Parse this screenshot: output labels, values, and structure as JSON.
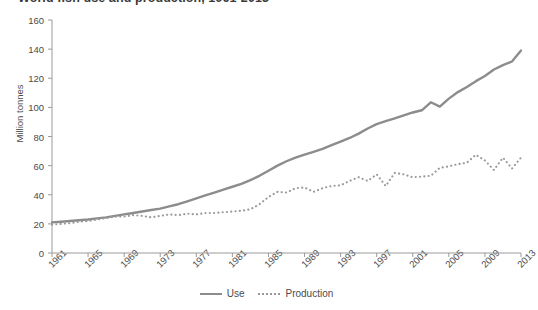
{
  "chart_data": {
    "type": "line",
    "title": "World fish use and production, 1961-2013",
    "xlabel": "",
    "ylabel": "Million tonnes",
    "ylim": [
      0,
      160
    ],
    "yticks": [
      0,
      20,
      40,
      60,
      80,
      100,
      120,
      140,
      160
    ],
    "xlim": [
      1961,
      2013
    ],
    "xticks": [
      1961,
      1965,
      1969,
      1973,
      1977,
      1981,
      1985,
      1989,
      1993,
      1997,
      2001,
      2005,
      2009,
      2013
    ],
    "xtick_labels": [
      "1961",
      "1965",
      "1969",
      "1973",
      "1977",
      "1981",
      "1985",
      "1989",
      "1993",
      "1997",
      "2001",
      "2005",
      "2009",
      "2013"
    ],
    "grid": false,
    "legend_position": "bottom-center",
    "x": [
      1961,
      1962,
      1963,
      1964,
      1965,
      1966,
      1967,
      1968,
      1969,
      1970,
      1971,
      1972,
      1973,
      1974,
      1975,
      1976,
      1977,
      1978,
      1979,
      1980,
      1981,
      1982,
      1983,
      1984,
      1985,
      1986,
      1987,
      1988,
      1989,
      1990,
      1991,
      1992,
      1993,
      1994,
      1995,
      1996,
      1997,
      1998,
      1999,
      2000,
      2001,
      2002,
      2003,
      2004,
      2005,
      2006,
      2007,
      2008,
      2009,
      2010,
      2011,
      2012,
      2013
    ],
    "series": [
      {
        "name": "Use",
        "style": "solid",
        "color": "#8c8c8c",
        "values": [
          21.0,
          21.5,
          22.0,
          22.5,
          23.0,
          23.8,
          24.5,
          25.5,
          26.5,
          27.5,
          28.5,
          29.5,
          30.5,
          32.0,
          33.5,
          35.5,
          37.5,
          39.5,
          41.5,
          43.5,
          45.5,
          47.5,
          50.0,
          53.0,
          56.5,
          60.0,
          63.0,
          65.5,
          67.5,
          69.5,
          71.5,
          74.0,
          76.5,
          79.0,
          82.0,
          85.5,
          88.5,
          90.5,
          92.5,
          94.5,
          96.5,
          98.0,
          103.5,
          100.5,
          106.0,
          110.5,
          114.0,
          118.0,
          121.5,
          126.0,
          129.0,
          131.5,
          139.0
        ]
      },
      {
        "name": "Production",
        "style": "dotted",
        "color": "#9a9a9a",
        "values": [
          19.5,
          20.0,
          20.5,
          21.5,
          22.0,
          23.0,
          24.0,
          25.0,
          25.0,
          26.0,
          25.5,
          24.5,
          25.5,
          26.5,
          26.0,
          27.0,
          26.5,
          27.5,
          27.5,
          28.0,
          28.5,
          29.0,
          30.0,
          33.5,
          38.5,
          42.0,
          41.5,
          44.5,
          45.0,
          42.0,
          44.5,
          46.0,
          46.5,
          49.5,
          52.0,
          49.5,
          54.0,
          46.0,
          55.0,
          54.0,
          52.0,
          52.5,
          53.0,
          58.5,
          59.5,
          61.0,
          62.0,
          67.5,
          63.5,
          57.0,
          65.5,
          58.0,
          65.5
        ]
      }
    ]
  }
}
